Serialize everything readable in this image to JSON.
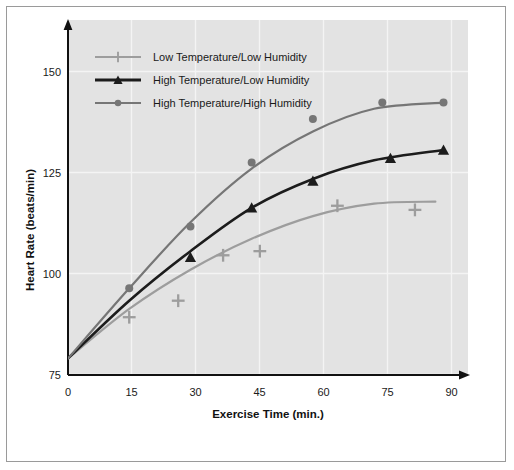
{
  "chart_data": {
    "type": "line",
    "title": "",
    "xlabel": "Exercise Time (min.)",
    "ylabel": "Heart Rate (beats/min)",
    "xlim": [
      0,
      98
    ],
    "ylim": [
      71,
      157
    ],
    "xticks": [
      0,
      15,
      30,
      45,
      60,
      75,
      90
    ],
    "yticks": [
      75,
      100,
      125,
      150
    ],
    "grid": true,
    "legend_position": "upper-left",
    "series": [
      {
        "name": "Low Temperature/Low Humidity",
        "marker": "plus",
        "color": "#9d9d9d",
        "points": [
          {
            "x": 15,
            "y": 85
          },
          {
            "x": 27,
            "y": 89
          },
          {
            "x": 38,
            "y": 100
          },
          {
            "x": 47,
            "y": 101
          },
          {
            "x": 66,
            "y": 112
          },
          {
            "x": 85,
            "y": 111
          }
        ],
        "fit_curve": [
          {
            "x": 0,
            "y": 75
          },
          {
            "x": 15,
            "y": 87
          },
          {
            "x": 30,
            "y": 96.5
          },
          {
            "x": 45,
            "y": 104
          },
          {
            "x": 60,
            "y": 109.5
          },
          {
            "x": 75,
            "y": 112.5
          },
          {
            "x": 90,
            "y": 113
          }
        ]
      },
      {
        "name": "High Temperature/Low Humidity",
        "marker": "triangle",
        "color": "#1c1c1c",
        "points": [
          {
            "x": 30,
            "y": 99.5
          },
          {
            "x": 45,
            "y": 111.5
          },
          {
            "x": 60,
            "y": 118
          },
          {
            "x": 79,
            "y": 123.5
          },
          {
            "x": 92,
            "y": 125.5
          }
        ],
        "fit_curve": [
          {
            "x": 0,
            "y": 75
          },
          {
            "x": 15,
            "y": 89
          },
          {
            "x": 30,
            "y": 101
          },
          {
            "x": 45,
            "y": 111.5
          },
          {
            "x": 60,
            "y": 118.5
          },
          {
            "x": 75,
            "y": 123
          },
          {
            "x": 92,
            "y": 125.5
          }
        ]
      },
      {
        "name": "High Temperature/High Humidity",
        "marker": "circle",
        "color": "#767676",
        "points": [
          {
            "x": 15,
            "y": 92
          },
          {
            "x": 30,
            "y": 107
          },
          {
            "x": 45,
            "y": 122.5
          },
          {
            "x": 60,
            "y": 133
          },
          {
            "x": 77,
            "y": 137
          },
          {
            "x": 92,
            "y": 137
          }
        ],
        "fit_curve": [
          {
            "x": 0,
            "y": 75
          },
          {
            "x": 15,
            "y": 92
          },
          {
            "x": 30,
            "y": 108
          },
          {
            "x": 45,
            "y": 121
          },
          {
            "x": 60,
            "y": 130
          },
          {
            "x": 75,
            "y": 135.5
          },
          {
            "x": 92,
            "y": 137
          }
        ]
      }
    ]
  },
  "legend": {
    "entries": [
      {
        "label": "Low Temperature/Low Humidity"
      },
      {
        "label": "High Temperature/Low Humidity"
      },
      {
        "label": "High Temperature/High Humidity"
      }
    ]
  },
  "axes": {
    "x_title": "Exercise Time (min.)",
    "y_title": "Heart Rate (beats/min)",
    "x_tick_labels": [
      "0",
      "15",
      "30",
      "45",
      "60",
      "75",
      "90"
    ],
    "y_tick_labels": [
      "75",
      "100",
      "125",
      "150"
    ]
  },
  "colors": {
    "plot_background": "#e3e3e3",
    "frame_border": "#9a9a9a",
    "axis_line": "#111111",
    "gridline": "#f2f2f2",
    "series_light": "#9d9d9d",
    "series_dark": "#1c1c1c",
    "series_mid": "#767676"
  }
}
